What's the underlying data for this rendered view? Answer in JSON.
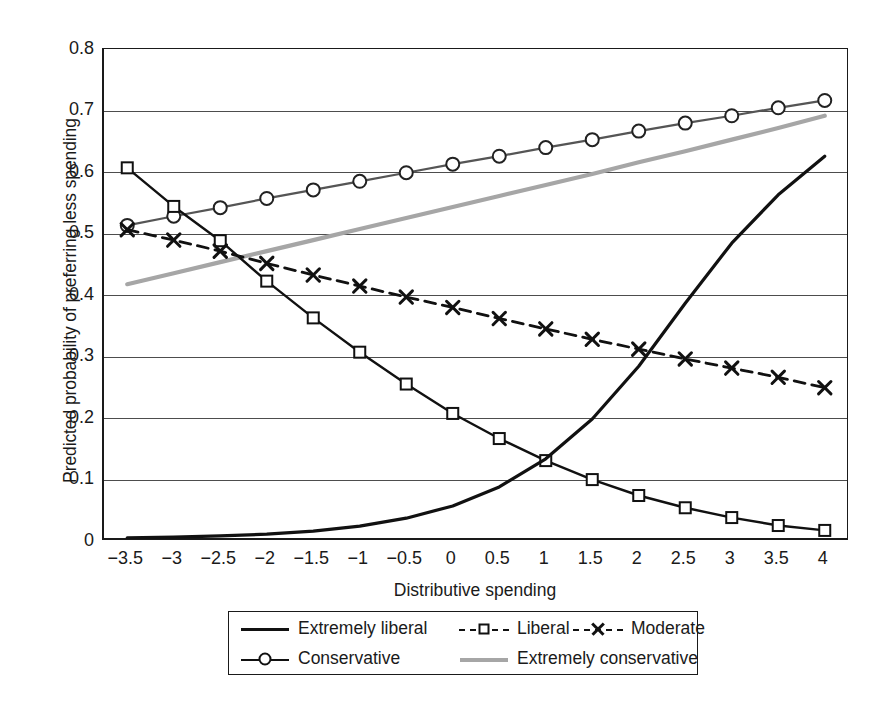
{
  "chart_data": {
    "type": "line",
    "title": "",
    "xlabel": "Distributive spending",
    "ylabel": "Predicted probability of preferring less spending",
    "xlim": [
      -3.75,
      4.25
    ],
    "ylim": [
      0.0,
      0.8
    ],
    "grid": "horizontal",
    "legend_position": "below-plot",
    "xticks": [
      "−3.5",
      "−3",
      "−2.5",
      "−2",
      "−1.5",
      "−1",
      "−0.5",
      "0",
      "0.5",
      "1",
      "1.5",
      "2",
      "2.5",
      "3",
      "3.5",
      "4"
    ],
    "xtick_values": [
      -3.5,
      -3,
      -2.5,
      -2,
      -1.5,
      -1,
      -0.5,
      0,
      0.5,
      1,
      1.5,
      2,
      2.5,
      3,
      3.5,
      4
    ],
    "yticks": [
      "0",
      "0.1",
      "0.2",
      "0.3",
      "0.4",
      "0.5",
      "0.6",
      "0.7",
      "0.8"
    ],
    "ytick_values": [
      0,
      0.1,
      0.2,
      0.3,
      0.4,
      0.5,
      0.6,
      0.7,
      0.8
    ],
    "x": [
      -3.5,
      -3,
      -2.5,
      -2,
      -1.5,
      -1,
      -0.5,
      0,
      0.5,
      1,
      1.5,
      2,
      2.5,
      3,
      3.5,
      4
    ],
    "series": [
      {
        "name": "Extremely liberal",
        "style": "solid",
        "color": "#111111",
        "marker": "none",
        "width": 3.2,
        "values": [
          0.002,
          0.003,
          0.005,
          0.008,
          0.013,
          0.021,
          0.034,
          0.054,
          0.085,
          0.131,
          0.196,
          0.282,
          0.385,
          0.483,
          0.562,
          0.625
        ]
      },
      {
        "name": "Liberal",
        "style": "solid",
        "color": "#111111",
        "marker": "square",
        "width": 2.4,
        "values": [
          0.606,
          0.543,
          0.487,
          0.421,
          0.361,
          0.305,
          0.253,
          0.205,
          0.164,
          0.128,
          0.097,
          0.071,
          0.051,
          0.035,
          0.022,
          0.014
        ]
      },
      {
        "name": "Moderate",
        "style": "dashed",
        "color": "#111111",
        "marker": "x",
        "width": 2.8,
        "values": [
          0.505,
          0.488,
          0.47,
          0.45,
          0.431,
          0.413,
          0.395,
          0.378,
          0.36,
          0.343,
          0.326,
          0.31,
          0.294,
          0.279,
          0.264,
          0.247
        ]
      },
      {
        "name": "Conservative",
        "style": "solid",
        "color": "#555555",
        "marker": "circle",
        "width": 2.2,
        "values": [
          0.512,
          0.527,
          0.541,
          0.556,
          0.57,
          0.584,
          0.598,
          0.612,
          0.625,
          0.639,
          0.652,
          0.666,
          0.679,
          0.691,
          0.704,
          0.716
        ]
      },
      {
        "name": "Extremely conservative",
        "style": "solid",
        "color": "#a6a6a6",
        "marker": "none",
        "width": 4.2,
        "values": [
          0.416,
          0.434,
          0.452,
          0.47,
          0.488,
          0.506,
          0.524,
          0.542,
          0.56,
          0.578,
          0.596,
          0.615,
          0.633,
          0.652,
          0.671,
          0.691
        ]
      }
    ],
    "legend": [
      {
        "label": "Extremely liberal",
        "swatch": "solid-black"
      },
      {
        "label": "Liberal",
        "swatch": "dash-square"
      },
      {
        "label": "Moderate",
        "swatch": "dash-x"
      },
      {
        "label": "Conservative",
        "swatch": "line-circle"
      },
      {
        "label": "Extremely conservative",
        "swatch": "solid-gray"
      }
    ]
  }
}
